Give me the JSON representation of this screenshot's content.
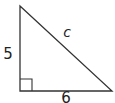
{
  "diagram": {
    "type": "right-triangle",
    "labels": {
      "vertical_leg": "5",
      "horizontal_leg": "6",
      "hypotenuse": "c"
    },
    "right_angle_marker": true,
    "colors": {
      "stroke": "#333333",
      "text": "#222222",
      "background": "#ffffff"
    }
  }
}
